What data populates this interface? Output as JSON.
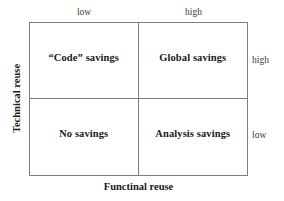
{
  "diagram": {
    "type": "2x2-matrix",
    "axes": {
      "x": {
        "title": "Functinal reuse",
        "tick_labels": [
          "low",
          "high"
        ]
      },
      "y": {
        "title": "Technical reuse",
        "tick_labels": [
          "high",
          "low"
        ]
      }
    },
    "quadrants": {
      "top_left": "“Code” savings",
      "top_right": "Global savings",
      "bottom_left": "No savings",
      "bottom_right": "Analysis savings"
    },
    "colors": {
      "line": "#7e7e7e",
      "text": "#1a1a1a",
      "tick_text": "#3a3a3a",
      "background": "#ffffff"
    }
  }
}
